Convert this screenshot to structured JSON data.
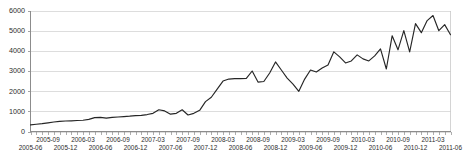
{
  "chart_data": {
    "type": "line",
    "title": "",
    "subtitle": "",
    "xlabel": "",
    "ylabel": "",
    "grid": true,
    "legend": false,
    "legend_position": "none",
    "series_color": "#262626",
    "gridline_color": "#d4d4d4",
    "axis_color": "#8c8c8c",
    "background_color": "#ffffff",
    "ylim": [
      0,
      6000
    ],
    "ytick_labels": [
      "0",
      "1000",
      "2000",
      "3000",
      "4000",
      "5000",
      "6000"
    ],
    "ytick_values": [
      0,
      1000,
      2000,
      3000,
      4000,
      5000,
      6000
    ],
    "xtick_labels": [
      "2005-06",
      "2005-09",
      "2005-12",
      "2006-03",
      "2006-06",
      "2006-09",
      "2006-12",
      "2007-03",
      "2007-06",
      "2007-09",
      "2007-12",
      "2008-03",
      "2008-06",
      "2008-09",
      "2008-12",
      "2009-03",
      "2009-06",
      "2009-09",
      "2009-12",
      "2010-03",
      "2010-06",
      "2010-09",
      "2010-12",
      "2011-03",
      "2011-06"
    ],
    "xtick_label_rows": 2,
    "x_minor_tick_interval_months": 1,
    "x": [
      "2005-06",
      "2005-07",
      "2005-08",
      "2005-09",
      "2005-10",
      "2005-11",
      "2005-12",
      "2006-01",
      "2006-02",
      "2006-03",
      "2006-04",
      "2006-05",
      "2006-06",
      "2006-07",
      "2006-08",
      "2006-09",
      "2006-10",
      "2006-11",
      "2006-12",
      "2007-01",
      "2007-02",
      "2007-03",
      "2007-04",
      "2007-05",
      "2007-06",
      "2007-07",
      "2007-08",
      "2007-09",
      "2007-10",
      "2007-11",
      "2007-12",
      "2008-01",
      "2008-02",
      "2008-03",
      "2008-04",
      "2008-05",
      "2008-06",
      "2008-07",
      "2008-08",
      "2008-09",
      "2008-10",
      "2008-11",
      "2008-12",
      "2009-01",
      "2009-02",
      "2009-03",
      "2009-04",
      "2009-05",
      "2009-06",
      "2009-07",
      "2009-08",
      "2009-09",
      "2009-10",
      "2009-11",
      "2009-12",
      "2010-01",
      "2010-02",
      "2010-03",
      "2010-04",
      "2010-05",
      "2010-06",
      "2010-07",
      "2010-08",
      "2010-09",
      "2010-10",
      "2010-11",
      "2010-12",
      "2011-01",
      "2011-02",
      "2011-03",
      "2011-04",
      "2011-05",
      "2011-06"
    ],
    "values": [
      330,
      360,
      390,
      430,
      470,
      500,
      520,
      530,
      545,
      560,
      600,
      690,
      700,
      660,
      700,
      720,
      740,
      760,
      790,
      800,
      840,
      900,
      1080,
      1020,
      860,
      900,
      1080,
      820,
      900,
      1050,
      1480,
      1700,
      2100,
      2500,
      2600,
      2620,
      2620,
      2630,
      3000,
      2450,
      2480,
      2900,
      3450,
      3050,
      2650,
      2350,
      1990,
      2600,
      3050,
      2950,
      3150,
      3300,
      3950,
      3700,
      3400,
      3500,
      3800,
      3600,
      3500,
      3750,
      4100,
      3100,
      4750,
      4050,
      5000,
      3950,
      5350,
      4900,
      5500,
      5750,
      5000,
      5300,
      4800
    ]
  }
}
